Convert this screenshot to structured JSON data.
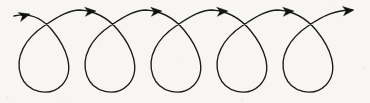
{
  "figure": {
    "name": "looping-cycloid-curve",
    "background_color": "#f7f6f3",
    "stroke_color": "#1b1b1b",
    "arrow_color": "#111111",
    "stroke_width": 1.35,
    "width": 370,
    "height": 103
  },
  "chart_data": {
    "type": "line",
    "title": "",
    "xlabel": "",
    "ylabel": "",
    "curve_type": "prolate cycloid / curlicue",
    "loop_count": 5,
    "arrow_count": 6,
    "direction": "left-to-right",
    "period": 66,
    "loop_bottom_y": 92,
    "crossing_y": 26,
    "baseline_y": 14,
    "path": "M 14,16 C 30,12 42,18 52,30 C 66,47 76,70 62,85 C 49,98 27,92 21,76 C 14,57 26,38 44,26 C 60,15 70,10 80,10 C 96,11 108,18 118,30 C 132,47 142,70 128,85 C 115,98 93,92 87,76 C 80,57 92,38 110,26 C 126,15 136,10 146,10 C 162,11 174,18 184,30 C 198,47 208,70 194,85 C 181,98 159,92 153,76 C 146,57 158,38 176,26 C 192,15 202,10 212,10 C 228,11 240,18 250,30 C 264,47 274,70 260,85 C 247,98 225,92 219,76 C 212,57 224,38 242,26 C 258,15 268,10 278,10 C 294,11 306,18 316,30 C 330,47 340,70 326,85 C 313,98 291,92 285,76 C 278,57 290,38 308,26 C 324,15 336,10 352,10"
  },
  "arrows": [
    {
      "name": "arrow-1",
      "x": 30,
      "y": 14,
      "angle": -16
    },
    {
      "name": "arrow-2",
      "x": 96,
      "y": 11,
      "angle": -4
    },
    {
      "name": "arrow-3",
      "x": 162,
      "y": 11,
      "angle": -4
    },
    {
      "name": "arrow-4",
      "x": 228,
      "y": 11,
      "angle": -4
    },
    {
      "name": "arrow-5",
      "x": 294,
      "y": 11,
      "angle": -4
    },
    {
      "name": "arrow-6",
      "x": 354,
      "y": 10,
      "angle": -6
    }
  ],
  "specks": [
    {
      "x": 6,
      "y": 96,
      "size": 3
    },
    {
      "x": 63,
      "y": 99,
      "size": 2
    },
    {
      "x": 152,
      "y": 3,
      "size": 2
    },
    {
      "x": 241,
      "y": 99,
      "size": 3
    },
    {
      "x": 330,
      "y": 5,
      "size": 2
    },
    {
      "x": 362,
      "y": 66,
      "size": 3
    },
    {
      "x": 180,
      "y": 56,
      "size": 2
    },
    {
      "x": 99,
      "y": 45,
      "size": 2
    }
  ]
}
